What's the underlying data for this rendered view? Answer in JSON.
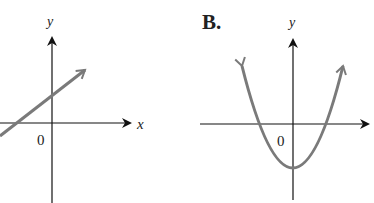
{
  "graphs": [
    {
      "id": "A",
      "label": "",
      "type": "line",
      "axis_labels": {
        "x": "x",
        "y": "y"
      },
      "origin_label": "0",
      "description": "Straight line with positive slope, positive y-intercept and negative x-intercept"
    },
    {
      "id": "B",
      "label": "B.",
      "type": "parabola",
      "axis_labels": {
        "x": "",
        "y": "y"
      },
      "origin_label": "0",
      "description": "Upward-opening parabola with vertex on negative y-axis, two x-intercepts symmetric about origin"
    }
  ],
  "colors": {
    "curve": "#7a7a7a",
    "axis": "#111111"
  }
}
